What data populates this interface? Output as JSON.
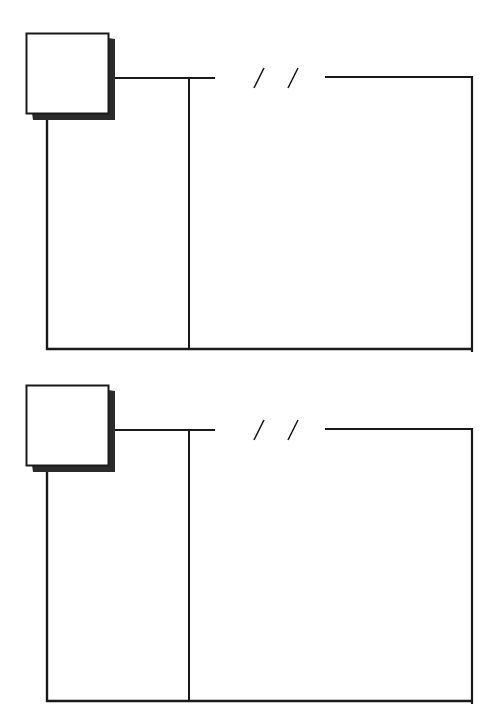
{
  "diagram": {
    "stroke_color": "#1a1a1a",
    "shadow_color": "#2b2b2b",
    "background": "#ffffff",
    "frames": [
      {
        "id": "frame-1",
        "top": 30
      },
      {
        "id": "frame-2",
        "top": 382
      }
    ],
    "break_marks": "//"
  }
}
